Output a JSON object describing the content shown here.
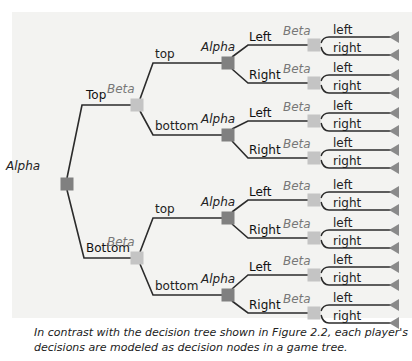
{
  "figure": {
    "colors": {
      "panel_bg": "#f3f3f1",
      "edge": "#2b2b2b",
      "alpha_node": "#808080",
      "beta_node": "#c4c4c4",
      "leaf": "#8a8a8a"
    },
    "root": {
      "player": "Alpha"
    },
    "level1": [
      {
        "label": "Top",
        "player": "Beta"
      },
      {
        "label": "Bottom",
        "player": "Beta"
      }
    ],
    "level2": [
      {
        "label": "top",
        "player": "Alpha"
      },
      {
        "label": "bottom",
        "player": "Alpha"
      },
      {
        "label": "top",
        "player": "Alpha"
      },
      {
        "label": "bottom",
        "player": "Alpha"
      }
    ],
    "level3": [
      {
        "label": "Left",
        "player": "Beta"
      },
      {
        "label": "Right",
        "player": "Beta"
      },
      {
        "label": "Left",
        "player": "Beta"
      },
      {
        "label": "Right",
        "player": "Beta"
      },
      {
        "label": "Left",
        "player": "Beta"
      },
      {
        "label": "Right",
        "player": "Beta"
      },
      {
        "label": "Left",
        "player": "Beta"
      },
      {
        "label": "Right",
        "player": "Beta"
      }
    ],
    "leaves": [
      {
        "label": "left"
      },
      {
        "label": "right"
      },
      {
        "label": "left"
      },
      {
        "label": "right"
      },
      {
        "label": "left"
      },
      {
        "label": "right"
      },
      {
        "label": "left"
      },
      {
        "label": "right"
      },
      {
        "label": "left"
      },
      {
        "label": "right"
      },
      {
        "label": "left"
      },
      {
        "label": "right"
      },
      {
        "label": "left"
      },
      {
        "label": "right"
      },
      {
        "label": "left"
      },
      {
        "label": "right"
      }
    ]
  },
  "caption": {
    "line1": "In contrast with the decision tree shown in Figure 2.2, each player's",
    "line2": "decisions are modeled as decision nodes in a game tree."
  }
}
